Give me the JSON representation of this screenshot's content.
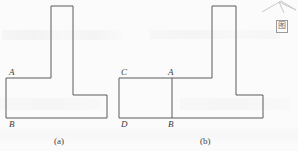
{
  "page": {
    "width": 298,
    "height": 151,
    "background_color": "#fbfbfb",
    "stroke_color": "#5a5a5a",
    "text_color": "#3a3a3a"
  },
  "figures": [
    {
      "id": "figure-a",
      "caption": "(a)",
      "caption_x": 54,
      "caption_y": 137,
      "description": "T-shaped / L-shaped polygon outline with vertical stem and horizontal base",
      "outline_points": "51,6 73,6 73,95 107,95 107,118 6,118 6,78 51,78",
      "labels": [
        {
          "name": "A",
          "text": "A",
          "x": 9,
          "y": 68
        },
        {
          "name": "B",
          "text": "B",
          "x": 9,
          "y": 120
        }
      ],
      "internal_segments": []
    },
    {
      "id": "figure-b",
      "caption": "(b)",
      "caption_x": 200,
      "caption_y": 137,
      "description": "Same T-shaped polygon with an extra rectangle CABD attached on the left and segment AB drawn",
      "outline_points": "212,6 236,6 236,95 263,95 263,118 119,118 119,78 212,78",
      "labels": [
        {
          "name": "C",
          "text": "C",
          "x": 121,
          "y": 68
        },
        {
          "name": "A",
          "text": "A",
          "x": 168,
          "y": 68
        },
        {
          "name": "D",
          "text": "D",
          "x": 121,
          "y": 120
        },
        {
          "name": "B",
          "text": "B",
          "x": 168,
          "y": 120
        }
      ],
      "internal_segments": [
        {
          "name": "segment-AB",
          "x1": 172,
          "y1": 78,
          "x2": 172,
          "y2": 118
        }
      ]
    }
  ],
  "corner_mark": {
    "glyph": "图",
    "x": 276,
    "y": 20
  },
  "corner_scribble": {
    "name": "pencil-arrow-mark",
    "points": "262,12 281,1 296,10 279,2 284,13"
  }
}
